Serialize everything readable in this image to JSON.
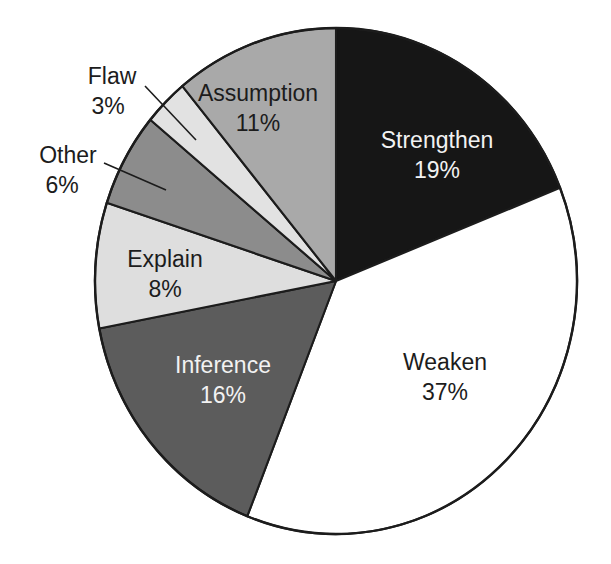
{
  "chart_data": {
    "type": "pie",
    "title": "",
    "subtitle": "",
    "xlabel": "",
    "ylabel": "",
    "legend_position": "none",
    "grid": false,
    "units": "percent",
    "start_angle_deg": 0,
    "direction": "clockwise",
    "total": 100,
    "categories": [
      "Strengthen",
      "Weaken",
      "Inference",
      "Explain",
      "Other",
      "Flaw",
      "Assumption"
    ],
    "values": [
      19,
      37,
      16,
      8,
      6,
      3,
      11
    ],
    "slices": [
      {
        "name": "Strengthen",
        "label": "Strengthen",
        "value": 19,
        "value_label": "19%",
        "color": "#161616",
        "text_color": "#f2f2f2",
        "label_placement": "inside",
        "start_deg": 0,
        "end_deg": 68.4,
        "label_x": 437,
        "label_y": 142,
        "value_x": 437,
        "value_y": 172
      },
      {
        "name": "Weaken",
        "label": "Weaken",
        "value": 37,
        "value_label": "37%",
        "color": "#ffffff",
        "text_color": "#1c1c1c",
        "label_placement": "inside",
        "start_deg": 68.4,
        "end_deg": 201.6,
        "label_x": 445,
        "label_y": 364,
        "value_x": 445,
        "value_y": 394
      },
      {
        "name": "Inference",
        "label": "Inference",
        "value": 16,
        "value_label": "16%",
        "color": "#5c5c5c",
        "text_color": "#f2f2f2",
        "label_placement": "inside",
        "start_deg": 201.6,
        "end_deg": 259.2,
        "label_x": 223,
        "label_y": 367,
        "value_x": 223,
        "value_y": 397
      },
      {
        "name": "Explain",
        "label": "Explain",
        "value": 8,
        "value_label": "8%",
        "color": "#dedede",
        "text_color": "#1c1c1c",
        "label_placement": "inside",
        "start_deg": 259.2,
        "end_deg": 288.0,
        "label_x": 165,
        "label_y": 261,
        "value_x": 165,
        "value_y": 291
      },
      {
        "name": "Other",
        "label": "Other",
        "value": 6,
        "value_label": "6%",
        "color": "#8c8c8c",
        "text_color": "#1c1c1c",
        "label_placement": "outside",
        "start_deg": 288.0,
        "end_deg": 309.6,
        "label_x": 68,
        "label_y": 157,
        "value_x": 62,
        "value_y": 187,
        "leader": {
          "x1": 104,
          "y1": 163,
          "x2": 166,
          "y2": 190
        }
      },
      {
        "name": "Flaw",
        "label": "Flaw",
        "value": 3,
        "value_label": "3%",
        "color": "#e2e2e2",
        "text_color": "#1c1c1c",
        "label_placement": "outside",
        "start_deg": 309.6,
        "end_deg": 320.4,
        "label_x": 112,
        "label_y": 78,
        "value_x": 108,
        "value_y": 108,
        "leader": {
          "x1": 145,
          "y1": 86,
          "x2": 196,
          "y2": 140
        }
      },
      {
        "name": "Assumption",
        "label": "Assumption",
        "value": 11,
        "value_label": "11%",
        "color": "#a9a9a9",
        "text_color": "#1c1c1c",
        "label_placement": "inside",
        "start_deg": 320.4,
        "end_deg": 360.0,
        "label_x": 258,
        "label_y": 95,
        "value_x": 258,
        "value_y": 125
      }
    ],
    "geometry": {
      "center_x": 336,
      "center_y": 281,
      "radius_x": 241,
      "radius_y": 253,
      "outline_color": "#1c1c1c"
    }
  }
}
